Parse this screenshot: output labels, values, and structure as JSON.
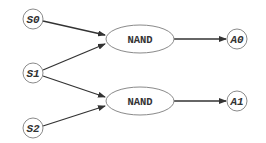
{
  "diagram": {
    "type": "logic-circuit-graph",
    "inputs": [
      {
        "id": "S0",
        "label": "S0"
      },
      {
        "id": "S1",
        "label": "S1"
      },
      {
        "id": "S2",
        "label": "S2"
      }
    ],
    "gates": [
      {
        "id": "g0",
        "label": "NAND"
      },
      {
        "id": "g1",
        "label": "NAND"
      }
    ],
    "outputs": [
      {
        "id": "A0",
        "label": "A0"
      },
      {
        "id": "A1",
        "label": "A1"
      }
    ],
    "edges": [
      {
        "from": "S0",
        "to": "g0"
      },
      {
        "from": "S1",
        "to": "g0"
      },
      {
        "from": "S1",
        "to": "g1"
      },
      {
        "from": "S2",
        "to": "g1"
      },
      {
        "from": "g0",
        "to": "A0"
      },
      {
        "from": "g1",
        "to": "A1"
      }
    ],
    "colors": {
      "stroke": "#8a8a8a",
      "edge": "#333333",
      "text": "#333333",
      "background": "#ffffff"
    }
  }
}
